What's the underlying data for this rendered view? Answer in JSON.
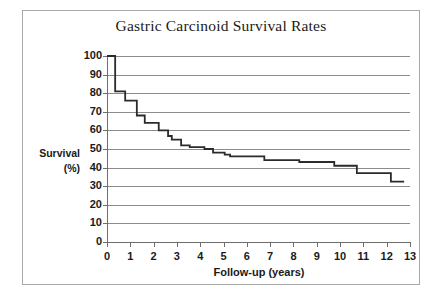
{
  "chart_data": {
    "type": "line",
    "subtype": "kaplan-meier-step",
    "title": "Gastric Carcinoid Survival Rates",
    "xlabel": "Follow-up (years)",
    "ylabel": "Survival (%)",
    "ylabel_lines": [
      "Survival",
      "(%)"
    ],
    "xlim": [
      0,
      13
    ],
    "ylim": [
      0,
      100
    ],
    "xticks": [
      0,
      1,
      2,
      3,
      4,
      5,
      6,
      7,
      8,
      9,
      10,
      11,
      12,
      13
    ],
    "yticks": [
      0,
      10,
      20,
      30,
      40,
      50,
      60,
      70,
      80,
      90,
      100
    ],
    "xtick_labels": [
      "0",
      "1",
      "2",
      "3",
      "4",
      "5",
      "6",
      "7",
      "8",
      "9",
      "10",
      "11",
      "12",
      "13"
    ],
    "ytick_labels": [
      "0",
      "10",
      "20",
      "30",
      "40",
      "50",
      "60",
      "70",
      "80",
      "90",
      "100"
    ],
    "grid": "horizontal",
    "legend": "none",
    "series": [
      {
        "name": "Survival",
        "color": "#2b2b2b",
        "x": [
          0.0,
          0.35,
          0.35,
          0.78,
          0.78,
          1.28,
          1.28,
          1.62,
          1.62,
          2.22,
          2.22,
          2.62,
          2.62,
          2.78,
          2.78,
          3.18,
          3.18,
          3.55,
          3.55,
          4.18,
          4.18,
          4.55,
          4.55,
          5.05,
          5.05,
          5.28,
          5.28,
          6.75,
          6.75,
          8.25,
          8.25,
          9.75,
          9.75,
          10.72,
          10.72,
          12.18,
          12.18,
          12.75
        ],
        "y": [
          100,
          100,
          81,
          81,
          76,
          76,
          68,
          68,
          64,
          64,
          60,
          60,
          57,
          57,
          55,
          55,
          52,
          52,
          51,
          51,
          50,
          50,
          48,
          48,
          47,
          47,
          46,
          46,
          44,
          44,
          43,
          43,
          41,
          41,
          37,
          37,
          32.5,
          32.5
        ],
        "step_points": [
          {
            "year": 0.0,
            "survival": 100
          },
          {
            "year": 0.35,
            "survival": 81
          },
          {
            "year": 0.78,
            "survival": 76
          },
          {
            "year": 1.28,
            "survival": 68
          },
          {
            "year": 1.62,
            "survival": 64
          },
          {
            "year": 2.22,
            "survival": 60
          },
          {
            "year": 2.62,
            "survival": 57
          },
          {
            "year": 2.78,
            "survival": 55
          },
          {
            "year": 3.18,
            "survival": 52
          },
          {
            "year": 3.55,
            "survival": 51
          },
          {
            "year": 4.18,
            "survival": 50
          },
          {
            "year": 4.55,
            "survival": 48
          },
          {
            "year": 5.05,
            "survival": 47
          },
          {
            "year": 5.28,
            "survival": 46
          },
          {
            "year": 6.75,
            "survival": 44
          },
          {
            "year": 8.25,
            "survival": 43
          },
          {
            "year": 9.75,
            "survival": 41
          },
          {
            "year": 10.72,
            "survival": 37
          },
          {
            "year": 12.18,
            "survival": 32.5
          },
          {
            "year": 12.75,
            "survival": 32.5
          }
        ]
      }
    ],
    "colors": {
      "curve": "#2b2b2b",
      "gridline": "#8c8c8c",
      "axis": "#6e6e6e",
      "border": "#a8a8a8",
      "text": "#1a1a1a",
      "background": "#ffffff"
    }
  }
}
